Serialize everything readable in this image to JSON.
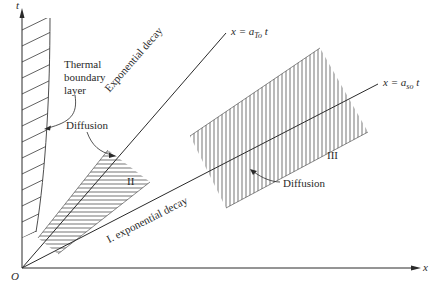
{
  "axes": {
    "vertical_label": "t",
    "horizontal_label": "x",
    "origin_label": "O"
  },
  "lines": {
    "thermal_front": {
      "prefix": "x = a",
      "subscript": "To",
      "suffix": " t",
      "along_label": "Exponential decay"
    },
    "sound_front": {
      "prefix": "x =  a",
      "subscript": "so",
      "suffix": " t",
      "along_label": "I. exponential decay"
    }
  },
  "regions": {
    "boundary_layer": {
      "label_line1": "Thermal",
      "label_line2": "boundary",
      "label_line3": "layer"
    },
    "region_II": {
      "label": "II",
      "annotation": "Diffusion"
    },
    "region_III": {
      "label": "III",
      "annotation": "Diffusion"
    }
  },
  "colors": {
    "ink": "#2a2a2a",
    "background": "#ffffff"
  }
}
